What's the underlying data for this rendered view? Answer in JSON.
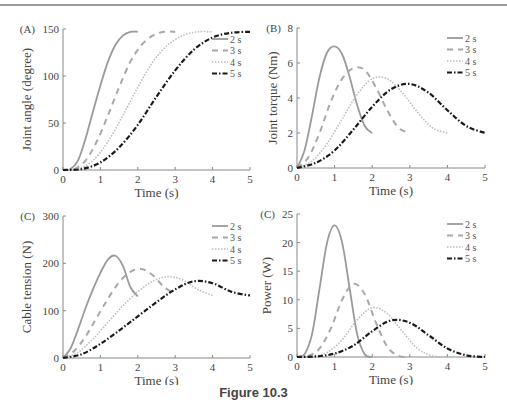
{
  "figure": {
    "caption": "Figure 10.3"
  },
  "styles": {
    "2 s": {
      "color": "#9a9a9a",
      "dash": "",
      "width": 1.8
    },
    "3 s": {
      "color": "#a8a8a8",
      "dash": "6,5",
      "width": 2.0
    },
    "4 s": {
      "color": "#bdbdbd",
      "dash": "1.5,1.5",
      "width": 1.6
    },
    "5 s": {
      "color": "#1a1a1a",
      "dash": "5,2,1.5,2",
      "width": 2.2
    }
  },
  "chart_data": [
    {
      "type": "line",
      "panel_label": "(A)",
      "title": "",
      "xlabel": "Time (s)",
      "ylabel": "Joint angle (degree)",
      "xlim": [
        0,
        5
      ],
      "ylim": [
        0,
        150
      ],
      "xticks": [
        0,
        1,
        2,
        3,
        4,
        5
      ],
      "yticks": [
        0,
        50,
        100,
        150
      ],
      "grid": false,
      "legend": [
        "2 s",
        "3 s",
        "4 s",
        "5 s"
      ],
      "legend_position": "upper right",
      "series": [
        {
          "name": "2 s",
          "x": [
            0,
            0.2,
            0.4,
            0.6,
            0.8,
            1.0,
            1.2,
            1.4,
            1.6,
            1.8,
            2.0
          ],
          "y": [
            0,
            1,
            10,
            33,
            62,
            90,
            115,
            133,
            143,
            147,
            147
          ]
        },
        {
          "name": "3 s",
          "x": [
            0,
            0.3,
            0.6,
            0.9,
            1.2,
            1.5,
            1.8,
            2.1,
            2.4,
            2.7,
            3.0
          ],
          "y": [
            0,
            1,
            10,
            30,
            58,
            88,
            115,
            133,
            143,
            147,
            147
          ]
        },
        {
          "name": "4 s",
          "x": [
            0,
            0.4,
            0.8,
            1.2,
            1.6,
            2.0,
            2.4,
            2.8,
            3.2,
            3.6,
            4.0
          ],
          "y": [
            0,
            1,
            10,
            30,
            58,
            88,
            115,
            133,
            143,
            147,
            147
          ]
        },
        {
          "name": "5 s",
          "x": [
            0,
            0.5,
            1.0,
            1.5,
            2.0,
            2.5,
            3.0,
            3.5,
            4.0,
            4.5,
            5.0
          ],
          "y": [
            0,
            1,
            8,
            24,
            48,
            78,
            106,
            128,
            141,
            146,
            147
          ]
        }
      ]
    },
    {
      "type": "line",
      "panel_label": "(B)",
      "title": "",
      "xlabel": "Time (s)",
      "ylabel": "Joint torque (Nm)",
      "xlim": [
        0,
        5
      ],
      "ylim": [
        0,
        8
      ],
      "xticks": [
        0,
        1,
        2,
        3,
        4,
        5
      ],
      "yticks": [
        0,
        2,
        4,
        6,
        8
      ],
      "grid": false,
      "legend": [
        "2 s",
        "3 s",
        "4 s",
        "5 s"
      ],
      "legend_position": "upper right",
      "series": [
        {
          "name": "2 s",
          "x": [
            0,
            0.2,
            0.4,
            0.6,
            0.8,
            1.0,
            1.2,
            1.4,
            1.6,
            1.8,
            2.0
          ],
          "y": [
            0,
            1.0,
            3.0,
            5.2,
            6.6,
            6.95,
            6.5,
            5.2,
            3.6,
            2.4,
            2.0
          ]
        },
        {
          "name": "3 s",
          "x": [
            0,
            0.3,
            0.6,
            0.9,
            1.2,
            1.5,
            1.8,
            2.1,
            2.4,
            2.7,
            3.0
          ],
          "y": [
            0,
            0.6,
            2.0,
            3.8,
            5.1,
            5.7,
            5.6,
            4.6,
            3.3,
            2.3,
            2.0
          ]
        },
        {
          "name": "4 s",
          "x": [
            0,
            0.4,
            0.8,
            1.2,
            1.6,
            2.0,
            2.4,
            2.8,
            3.2,
            3.6,
            4.0
          ],
          "y": [
            0,
            0.4,
            1.4,
            2.8,
            4.2,
            5.1,
            5.1,
            4.3,
            3.2,
            2.3,
            2.0
          ]
        },
        {
          "name": "5 s",
          "x": [
            0,
            0.5,
            1.0,
            1.5,
            2.0,
            2.5,
            3.0,
            3.5,
            4.0,
            4.5,
            5.0
          ],
          "y": [
            0,
            0.3,
            1.0,
            2.2,
            3.5,
            4.5,
            4.8,
            4.3,
            3.3,
            2.4,
            2.0
          ]
        }
      ]
    },
    {
      "type": "line",
      "panel_label": "(C)",
      "title": "",
      "xlabel": "Time (s)",
      "ylabel": "Cable tension (N)",
      "xlim": [
        0,
        5
      ],
      "ylim": [
        0,
        300
      ],
      "xticks": [
        0,
        1,
        2,
        3,
        4,
        5
      ],
      "yticks": [
        0,
        100,
        200,
        300
      ],
      "grid": false,
      "legend": [
        "2 s",
        "3 s",
        "4 s",
        "5 s"
      ],
      "legend_position": "upper right",
      "series": [
        {
          "name": "2 s",
          "x": [
            0,
            0.2,
            0.4,
            0.6,
            0.8,
            1.0,
            1.2,
            1.4,
            1.6,
            1.8,
            2.0
          ],
          "y": [
            0,
            20,
            60,
            105,
            145,
            180,
            208,
            216,
            195,
            150,
            130
          ]
        },
        {
          "name": "3 s",
          "x": [
            0,
            0.3,
            0.6,
            0.9,
            1.2,
            1.5,
            1.8,
            2.1,
            2.4,
            2.7,
            3.0
          ],
          "y": [
            0,
            15,
            45,
            85,
            125,
            160,
            182,
            188,
            175,
            150,
            135
          ]
        },
        {
          "name": "4 s",
          "x": [
            0,
            0.4,
            0.8,
            1.2,
            1.6,
            2.0,
            2.4,
            2.8,
            3.2,
            3.6,
            4.0
          ],
          "y": [
            0,
            12,
            40,
            75,
            110,
            140,
            162,
            172,
            165,
            145,
            132
          ]
        },
        {
          "name": "5 s",
          "x": [
            0,
            0.5,
            1.0,
            1.5,
            2.0,
            2.5,
            3.0,
            3.5,
            4.0,
            4.5,
            5.0
          ],
          "y": [
            0,
            8,
            30,
            58,
            88,
            118,
            145,
            162,
            158,
            140,
            132
          ]
        }
      ]
    },
    {
      "type": "line",
      "panel_label": "(C)",
      "title": "",
      "xlabel": "Time (s)",
      "ylabel": "Power (W)",
      "xlim": [
        0,
        5
      ],
      "ylim": [
        0,
        25
      ],
      "xticks": [
        0,
        1,
        2,
        3,
        4,
        5
      ],
      "yticks": [
        0,
        5,
        10,
        15,
        20,
        25
      ],
      "grid": false,
      "legend": [
        "2 s",
        "3 s",
        "4 s",
        "5 s"
      ],
      "legend_position": "upper right",
      "series": [
        {
          "name": "2 s",
          "x": [
            0,
            0.2,
            0.4,
            0.6,
            0.8,
            1.0,
            1.2,
            1.4,
            1.6,
            1.8,
            2.0
          ],
          "y": [
            0,
            0.5,
            4,
            12,
            20,
            23,
            20,
            12,
            4,
            0.5,
            0
          ]
        },
        {
          "name": "3 s",
          "x": [
            0,
            0.3,
            0.6,
            0.9,
            1.2,
            1.5,
            1.8,
            2.1,
            2.4,
            2.7,
            3.0
          ],
          "y": [
            0,
            0.2,
            1.5,
            5,
            10,
            12.8,
            11,
            6,
            1.8,
            0.2,
            0
          ]
        },
        {
          "name": "4 s",
          "x": [
            0,
            0.4,
            0.8,
            1.2,
            1.6,
            2.0,
            2.4,
            2.8,
            3.2,
            3.6,
            4.0
          ],
          "y": [
            0,
            0.1,
            0.8,
            3,
            6.5,
            8.6,
            7.6,
            4.5,
            1.5,
            0.2,
            0
          ]
        },
        {
          "name": "5 s",
          "x": [
            0,
            0.5,
            1.0,
            1.5,
            2.0,
            2.5,
            3.0,
            3.5,
            4.0,
            4.5,
            5.0
          ],
          "y": [
            0,
            0.1,
            0.6,
            2,
            4.5,
            6.4,
            6,
            3.8,
            1.5,
            0.3,
            0
          ]
        }
      ]
    }
  ],
  "layout": [
    {
      "x0": 63,
      "x1": 250,
      "y0": 170,
      "y1": 29
    },
    {
      "x0": 297,
      "x1": 485,
      "y0": 168,
      "y1": 28
    },
    {
      "x0": 63,
      "x1": 250,
      "y0": 358,
      "y1": 216
    },
    {
      "x0": 297,
      "x1": 485,
      "y0": 357,
      "y1": 214
    }
  ]
}
